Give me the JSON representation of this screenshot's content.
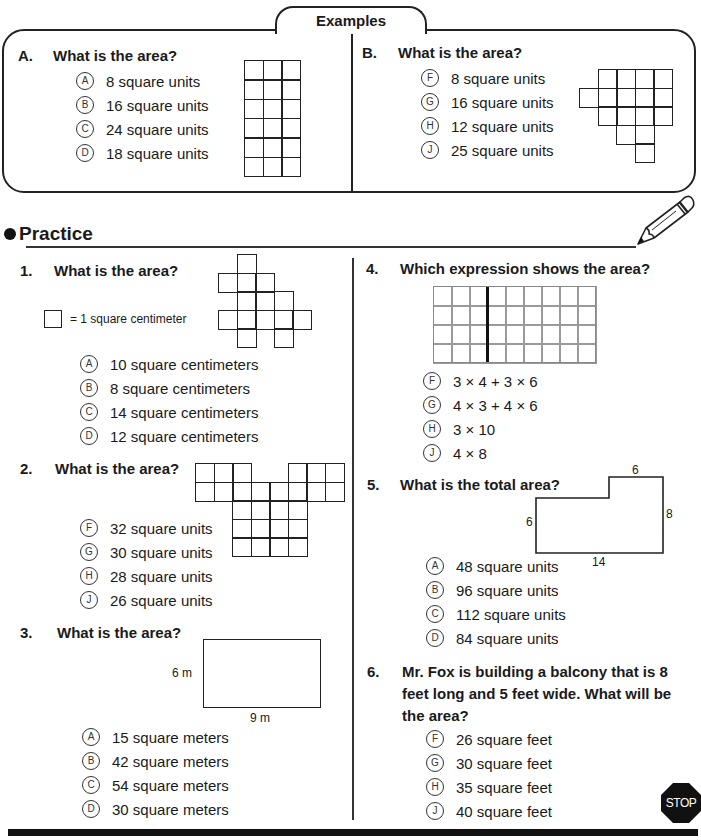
{
  "examples": {
    "tab_label": "Examples",
    "A": {
      "number": "A.",
      "question": "What is the area?",
      "options": [
        {
          "letter": "A",
          "text": "8 square units"
        },
        {
          "letter": "B",
          "text": "16 square units"
        },
        {
          "letter": "C",
          "text": "24 square units"
        },
        {
          "letter": "D",
          "text": "18 square units"
        }
      ],
      "figure": {
        "type": "grid",
        "cols": 3,
        "rows": 6
      }
    },
    "B": {
      "number": "B.",
      "question": "What is the area?",
      "options": [
        {
          "letter": "F",
          "text": "8 square units"
        },
        {
          "letter": "G",
          "text": "16 square units"
        },
        {
          "letter": "H",
          "text": "12 square units"
        },
        {
          "letter": "J",
          "text": "25 square units"
        }
      ],
      "figure": {
        "type": "grid-shape",
        "rows": [
          [
            2,
            3,
            4,
            5
          ],
          [
            1,
            2,
            3,
            4,
            5
          ],
          [
            2,
            3,
            4,
            5
          ],
          [
            3,
            4
          ],
          [
            4
          ]
        ]
      }
    }
  },
  "practice": {
    "title": "Practice",
    "q1": {
      "number": "1.",
      "question": "What is the area?",
      "legend": "= 1 square centimeter",
      "options": [
        {
          "letter": "A",
          "text": "10 square centimeters"
        },
        {
          "letter": "B",
          "text": "8 square centimeters"
        },
        {
          "letter": "C",
          "text": "14 square centimeters"
        },
        {
          "letter": "D",
          "text": "12 square centimeters"
        }
      ],
      "figure": {
        "type": "grid-shape",
        "rows": [
          [
            2
          ],
          [
            1,
            2,
            3
          ],
          [
            2,
            3,
            4
          ],
          [
            1,
            2,
            3,
            4,
            5
          ],
          [
            2,
            4
          ]
        ]
      }
    },
    "q2": {
      "number": "2.",
      "question": "What is the area?",
      "options": [
        {
          "letter": "F",
          "text": "32 square units"
        },
        {
          "letter": "G",
          "text": "30 square units"
        },
        {
          "letter": "H",
          "text": "28 square units"
        },
        {
          "letter": "J",
          "text": "26 square units"
        }
      ],
      "figure": {
        "type": "grid-shape",
        "rows": [
          [
            1,
            2,
            3,
            6,
            7,
            8
          ],
          [
            1,
            2,
            3,
            4,
            5,
            6,
            7,
            8
          ],
          [
            3,
            4,
            5,
            6
          ],
          [
            3,
            4,
            5,
            6
          ],
          [
            3,
            4,
            5,
            6
          ]
        ]
      }
    },
    "q3": {
      "number": "3.",
      "question": "What is the area?",
      "figure": {
        "type": "rectangle",
        "height_label": "6 m",
        "width_label": "9 m"
      },
      "options": [
        {
          "letter": "A",
          "text": "15 square meters"
        },
        {
          "letter": "B",
          "text": "42 square meters"
        },
        {
          "letter": "C",
          "text": "54 square meters"
        },
        {
          "letter": "D",
          "text": "30 square meters"
        }
      ]
    },
    "q4": {
      "number": "4.",
      "question": "Which expression shows the area?",
      "figure": {
        "type": "grid",
        "cols": 9,
        "rows": 4,
        "divider_after_col": 3
      },
      "options": [
        {
          "letter": "F",
          "text": "3 × 4 + 3 × 6"
        },
        {
          "letter": "G",
          "text": "4 × 3 + 4 × 6"
        },
        {
          "letter": "H",
          "text": "3 × 10"
        },
        {
          "letter": "J",
          "text": "4 × 8"
        }
      ]
    },
    "q5": {
      "number": "5.",
      "question": "What is the total area?",
      "figure": {
        "type": "l-shape",
        "labels": {
          "top": "6",
          "right": "8",
          "left": "6",
          "bottom": "14"
        }
      },
      "options": [
        {
          "letter": "A",
          "text": "48 square units"
        },
        {
          "letter": "B",
          "text": "96 square units"
        },
        {
          "letter": "C",
          "text": "112 square units"
        },
        {
          "letter": "D",
          "text": "84 square units"
        }
      ]
    },
    "q6": {
      "number": "6.",
      "question_lines": [
        "Mr. Fox is building a balcony that is 8",
        "feet long and 5 feet wide. What will be",
        "the area?"
      ],
      "options": [
        {
          "letter": "F",
          "text": "26 square feet"
        },
        {
          "letter": "G",
          "text": "30 square feet"
        },
        {
          "letter": "H",
          "text": "35 square feet"
        },
        {
          "letter": "J",
          "text": "40 square feet"
        }
      ]
    }
  },
  "icons": {
    "pencil": "pencil-icon",
    "stop": "stop-sign-icon"
  },
  "stop_label": "STOP"
}
